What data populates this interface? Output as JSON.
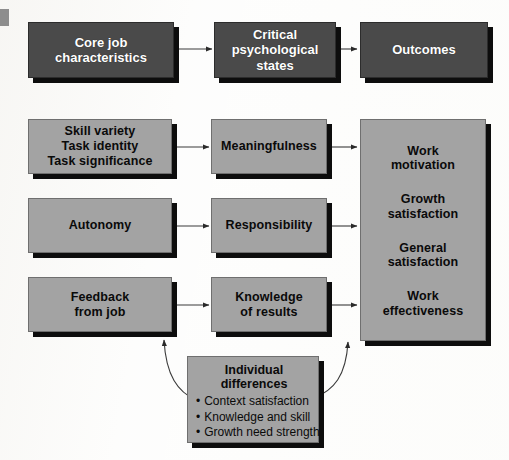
{
  "diagram": {
    "title_row": {
      "boxes": [
        {
          "id": "core-job-characteristics",
          "label": "Core job\ncharacteristics"
        },
        {
          "id": "critical-psychological-states",
          "label": "Critical\npsychological\nstates"
        },
        {
          "id": "outcomes",
          "label": "Outcomes"
        }
      ]
    },
    "job_characteristics": [
      {
        "id": "skill-variety-group",
        "lines": [
          "Skill variety",
          "Task identity",
          "Task significance"
        ]
      },
      {
        "id": "autonomy",
        "lines": [
          "Autonomy"
        ]
      },
      {
        "id": "feedback-from-job",
        "lines": [
          "Feedback",
          "from job"
        ]
      }
    ],
    "psychological_states": [
      {
        "id": "meaningfulness",
        "lines": [
          "Meaningfulness"
        ]
      },
      {
        "id": "responsibility",
        "lines": [
          "Responsibility"
        ]
      },
      {
        "id": "knowledge-of-results",
        "lines": [
          "Knowledge",
          "of results"
        ]
      }
    ],
    "outcomes_box": {
      "id": "outcomes-list",
      "items": [
        [
          "Work",
          "motivation"
        ],
        [
          "Growth",
          "satisfaction"
        ],
        [
          "General",
          "satisfaction"
        ],
        [
          "Work",
          "effectiveness"
        ]
      ]
    },
    "individual_differences": {
      "id": "individual-differences",
      "title": [
        "Individual",
        "differences"
      ],
      "bullets": [
        "Context satisfaction",
        "Knowledge and skill",
        "Growth need strength"
      ]
    },
    "colors": {
      "header_box_fill": "#4a4a4a",
      "header_box_text": "#ffffff",
      "body_box_fill": "#a3a3a3",
      "body_box_text": "#0a0a0a",
      "shadow": "#0d0d0d",
      "arrow": "#3a3a3a",
      "background": "#fdfdfc"
    }
  }
}
